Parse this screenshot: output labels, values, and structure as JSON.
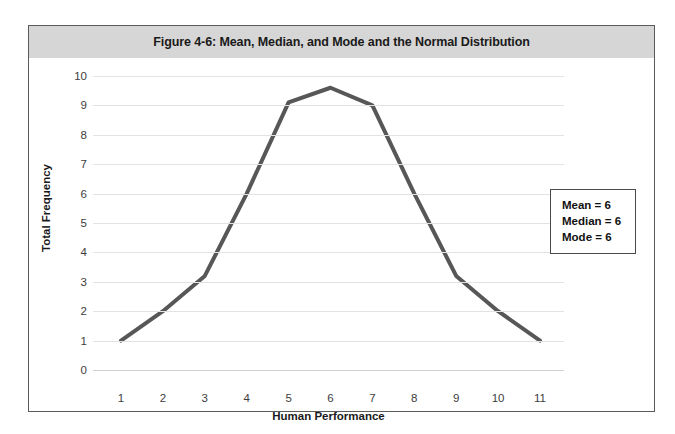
{
  "figure": {
    "title": "Figure 4-6: Mean, Median, and Mode and the Normal Distribution"
  },
  "stats_box": {
    "mean": "Mean = 6",
    "median": "Median = 6",
    "mode": "Mode = 6"
  },
  "chart_data": {
    "type": "line",
    "title": "Figure 4-6: Mean, Median, and Mode and the Normal Distribution",
    "xlabel": "Human Performance",
    "ylabel": "Total Frequency",
    "x": [
      1,
      2,
      3,
      4,
      5,
      6,
      7,
      8,
      9,
      10,
      11
    ],
    "values": [
      1,
      2,
      3.2,
      6,
      9.1,
      9.6,
      9,
      6,
      3.2,
      2,
      1
    ],
    "categories": [
      "1",
      "2",
      "3",
      "4",
      "5",
      "6",
      "7",
      "8",
      "9",
      "10",
      "11"
    ],
    "xticklabels": [
      "1",
      "2",
      "3",
      "4",
      "5",
      "6",
      "7",
      "8",
      "9",
      "10",
      "11"
    ],
    "yticklabels": [
      "0",
      "1",
      "2",
      "3",
      "4",
      "5",
      "6",
      "7",
      "8",
      "9",
      "10"
    ],
    "ylim": [
      0,
      10
    ],
    "xlim": [
      1,
      11
    ],
    "grid": "horizontal",
    "legend": "none",
    "line_color": "#575757",
    "line_width": 4,
    "annotations": [
      "Mean = 6",
      "Median = 6",
      "Mode = 6"
    ]
  },
  "colors": {
    "line": "#575757",
    "title_band": "#d6d6d6",
    "frame_border": "#5a5a5a",
    "gridline": "#e2e2e2",
    "stats_border": "#4a4a4a"
  }
}
